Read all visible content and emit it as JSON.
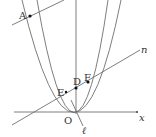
{
  "diagram": {
    "type": "coordinate-geometry",
    "colors": {
      "stroke": "#6f6f6f",
      "point": "#111111",
      "text": "#333333",
      "background": "#ffffff"
    },
    "axes": {
      "x_label": "x",
      "origin_label": "O"
    },
    "points": [
      {
        "id": "A",
        "label": "A",
        "x": 30,
        "y": 16
      },
      {
        "id": "D",
        "label": "D",
        "x": 76,
        "y": 88
      },
      {
        "id": "E",
        "label": "E",
        "x": 66,
        "y": 92
      },
      {
        "id": "F",
        "label": "F",
        "x": 88,
        "y": 85
      },
      {
        "id": "O",
        "label": "O",
        "x": 76,
        "y": 112
      }
    ],
    "lines": [
      {
        "id": "n",
        "label": "n"
      },
      {
        "id": "l",
        "label": "ℓ"
      }
    ],
    "curves": [
      {
        "id": "parabola-outer"
      },
      {
        "id": "parabola-inner"
      }
    ]
  }
}
